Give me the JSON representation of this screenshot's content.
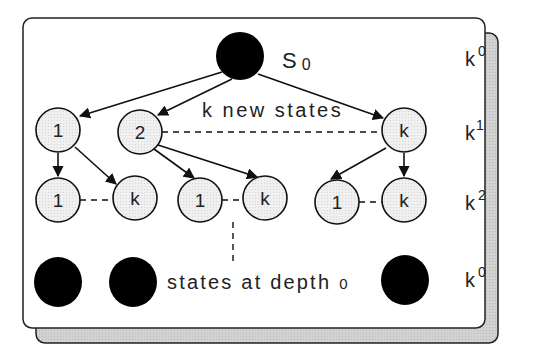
{
  "diagram": {
    "root": {
      "label": "S",
      "subscript": "0"
    },
    "annotation_top": "k new states",
    "annotation_bottom": "states at depth",
    "annotation_bottom_sub": "0",
    "level1": [
      {
        "label": "1"
      },
      {
        "label": "2"
      },
      {
        "label": "k"
      }
    ],
    "level2": [
      {
        "label": "1"
      },
      {
        "label": "k"
      },
      {
        "label": "1"
      },
      {
        "label": "k"
      },
      {
        "label": "1"
      },
      {
        "label": "k"
      }
    ],
    "level_labels": [
      {
        "base": "k",
        "exp": "0"
      },
      {
        "base": "k",
        "exp": "1"
      },
      {
        "base": "k",
        "exp": "2"
      },
      {
        "base": "k",
        "exp": "0"
      }
    ],
    "colors": {
      "node_fill": "#ececec",
      "node_stroke": "#111111",
      "terminal_fill": "#000000",
      "shadow": "#cfcfcf",
      "panel": "#ffffff"
    }
  }
}
